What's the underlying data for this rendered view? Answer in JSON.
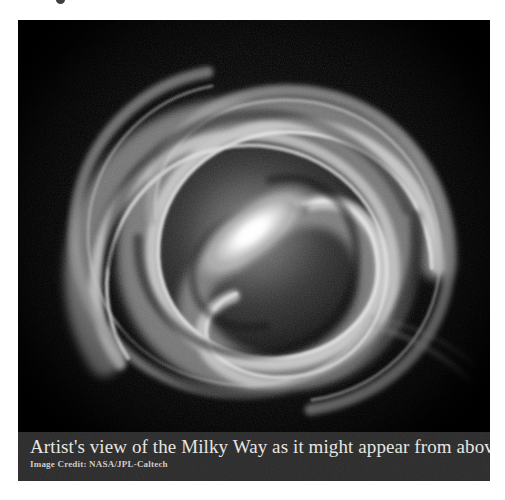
{
  "figure": {
    "panel_background": "#000000",
    "caption_background": "#2b2b2b",
    "page_background": "#ffffff",
    "image": {
      "name": "milky-way-artist-concept",
      "subject": "Milky Way galaxy seen face-on from above",
      "rendering": "grayscale barred spiral galaxy",
      "palette": {
        "space": "#000000",
        "disc_glow": "#6e6e6e",
        "arm_bright": "#d8d8d8",
        "core_bright": "#ffffff",
        "dust_lane": "#1a1a1a"
      },
      "structure": {
        "center_x": 252,
        "center_y": 232,
        "bar_angle_deg": -38,
        "bar_length": 118,
        "bar_width": 46,
        "arm_count": 4,
        "winding": "counterclockwise outward",
        "disc_radius": 178
      }
    },
    "caption": {
      "title": "Artist's view of the Milky Way as it might appear from above",
      "credit": "Image  Credit: NASA/JPL-Caltech"
    }
  }
}
